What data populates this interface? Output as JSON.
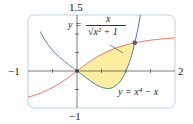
{
  "chart_data": {
    "type": "line",
    "title": "",
    "xlabel": "",
    "ylabel": "",
    "xlim": [
      -1,
      2
    ],
    "ylim": [
      -1,
      1.5
    ],
    "x_tick_labels": [
      "-1",
      "2"
    ],
    "y_tick_labels": [
      "1.5",
      "-1"
    ],
    "grid": false,
    "series": [
      {
        "name": "y = x / sqrt(x^2 + 1)",
        "color": "#e8735a",
        "x": [
          -1,
          -0.5,
          0,
          0.5,
          1,
          1.18,
          1.5,
          2
        ],
        "y": [
          -0.707,
          -0.447,
          0,
          0.447,
          0.707,
          0.763,
          0.832,
          0.894
        ]
      },
      {
        "name": "y = x^4 - x",
        "color": "#4a7ab5",
        "x": [
          -0.6,
          -0.5,
          0,
          0.5,
          0.63,
          1,
          1.18,
          1.25
        ],
        "y": [
          0.73,
          0.5625,
          0,
          -0.4375,
          -0.472,
          0,
          0.76,
          1.19
        ]
      }
    ],
    "shaded_region": {
      "between": [
        "y = x / sqrt(x^2 + 1)",
        "y = x^4 - x"
      ],
      "x_range": [
        0,
        1.18
      ],
      "color": "#fbeea0"
    },
    "intersection_points": [
      [
        0,
        0
      ],
      [
        1.18,
        0.763
      ]
    ],
    "annotations": [
      "y = x / sqrt(x^2+1)",
      "y = x^4 - x"
    ]
  },
  "labels": {
    "y_top": "1.5",
    "y_bottom": "−1",
    "x_left": "−1",
    "x_right": "2",
    "curve1_y": "y =",
    "curve1_num": "x",
    "curve1_den": "√x² + 1",
    "curve2": "y = x⁴ − x"
  }
}
